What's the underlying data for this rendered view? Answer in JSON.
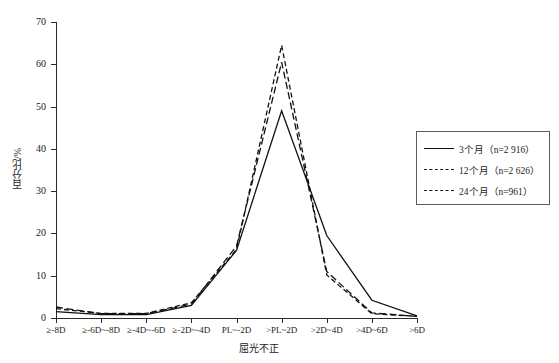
{
  "chart_data": {
    "type": "line",
    "title": "",
    "xlabel": "屈光不正",
    "ylabel": "百分比/%",
    "ylim": [
      0,
      70
    ],
    "ytick_step": 10,
    "yticks": [
      "0",
      "10",
      "20",
      "30",
      "40",
      "50",
      "60",
      "70"
    ],
    "grid": false,
    "legend_position": "right",
    "categories": [
      "≥-8D",
      "≥-6D~-8D",
      "≥-4D~-6D",
      "≥-2D~-4D",
      "PL~-2D",
      ">PL~2D",
      ">2D~4D",
      ">4D~6D",
      ">6D"
    ],
    "series": [
      {
        "name": "3个月（n=2 916）",
        "short_name": "3个月",
        "n": "2 916",
        "line_style": "solid",
        "values": [
          1.5,
          0.8,
          0.8,
          3.0,
          16.0,
          49.0,
          19.5,
          4.2,
          0.5
        ]
      },
      {
        "name": "12个月（n=2 626）",
        "short_name": "12个月",
        "n": "2 626",
        "line_style": "dashed",
        "values": [
          2.6,
          1.0,
          1.0,
          3.3,
          17.0,
          60.5,
          11.0,
          1.2,
          0.4
        ]
      },
      {
        "name": "24个月（n=961）",
        "short_name": "24个月",
        "n": "961",
        "line_style": "dash-dot",
        "values": [
          2.2,
          1.1,
          1.1,
          3.6,
          16.2,
          64.5,
          10.2,
          1.0,
          0.4
        ]
      }
    ]
  },
  "axes": {
    "y_title": "百分比/%",
    "x_title": "屈光不正"
  },
  "legend": {
    "items": [
      {
        "label": "3个月（n=2 916）",
        "style": "solid"
      },
      {
        "label": "12个月（n=2 626）",
        "style": "dashed"
      },
      {
        "label": "24个月（n=961）",
        "style": "dash-dot"
      }
    ]
  },
  "colors": {
    "line": "#111111",
    "axis": "#2b2b2b",
    "legend_border": "#5b5b5b",
    "background": "#ffffff"
  }
}
